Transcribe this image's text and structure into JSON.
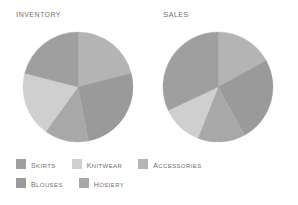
{
  "chart_data": [
    {
      "type": "pie",
      "title": "Inventory",
      "categories": [
        "Accessories",
        "Blouses",
        "Hosiery",
        "Knitwear",
        "Skirts"
      ],
      "values": [
        21,
        26,
        13,
        19,
        21
      ],
      "unit": "percent",
      "start_angle_deg": 0,
      "direction": "clockwise",
      "legend": "bottom",
      "grid": false,
      "xlabel": "",
      "ylabel": ""
    },
    {
      "type": "pie",
      "title": "Sales",
      "categories": [
        "Accessories",
        "Blouses",
        "Hosiery",
        "Knitwear",
        "Skirts"
      ],
      "values": [
        17,
        25,
        14,
        12,
        32
      ],
      "unit": "percent",
      "start_angle_deg": 0,
      "direction": "clockwise",
      "legend": "bottom",
      "grid": false,
      "xlabel": "",
      "ylabel": ""
    }
  ],
  "charts": {
    "inventory": {
      "title": "Inventory",
      "slices": [
        {
          "label": "Accessories",
          "value": 21,
          "color": "#b4b4b4"
        },
        {
          "label": "Blouses",
          "value": 26,
          "color": "#9a9a9a"
        },
        {
          "label": "Hosiery",
          "value": 13,
          "color": "#a8a8a8"
        },
        {
          "label": "Knitwear",
          "value": 19,
          "color": "#cfcfcf"
        },
        {
          "label": "Skirts",
          "value": 21,
          "color": "#9f9f9f"
        }
      ]
    },
    "sales": {
      "title": "Sales",
      "slices": [
        {
          "label": "Accessories",
          "value": 17,
          "color": "#b4b4b4"
        },
        {
          "label": "Blouses",
          "value": 25,
          "color": "#9a9a9a"
        },
        {
          "label": "Hosiery",
          "value": 14,
          "color": "#a8a8a8"
        },
        {
          "label": "Knitwear",
          "value": 12,
          "color": "#cfcfcf"
        },
        {
          "label": "Skirts",
          "value": 32,
          "color": "#9f9f9f"
        }
      ]
    }
  },
  "legend": {
    "rows": [
      [
        {
          "label": "Skirts",
          "color": "#9f9f9f"
        },
        {
          "label": "Knitwear",
          "color": "#cfcfcf"
        },
        {
          "label": "Accessories",
          "color": "#b4b4b4"
        }
      ],
      [
        {
          "label": "Blouses",
          "color": "#9a9a9a"
        },
        {
          "label": "Hosiery",
          "color": "#a8a8a8"
        }
      ]
    ]
  },
  "colors": {
    "text": "#6f6f6f",
    "background": "#ffffff",
    "skirts": "#9f9f9f",
    "knitwear": "#cfcfcf",
    "accessories": "#b4b4b4",
    "blouses": "#9a9a9a",
    "hosiery": "#a8a8a8"
  }
}
